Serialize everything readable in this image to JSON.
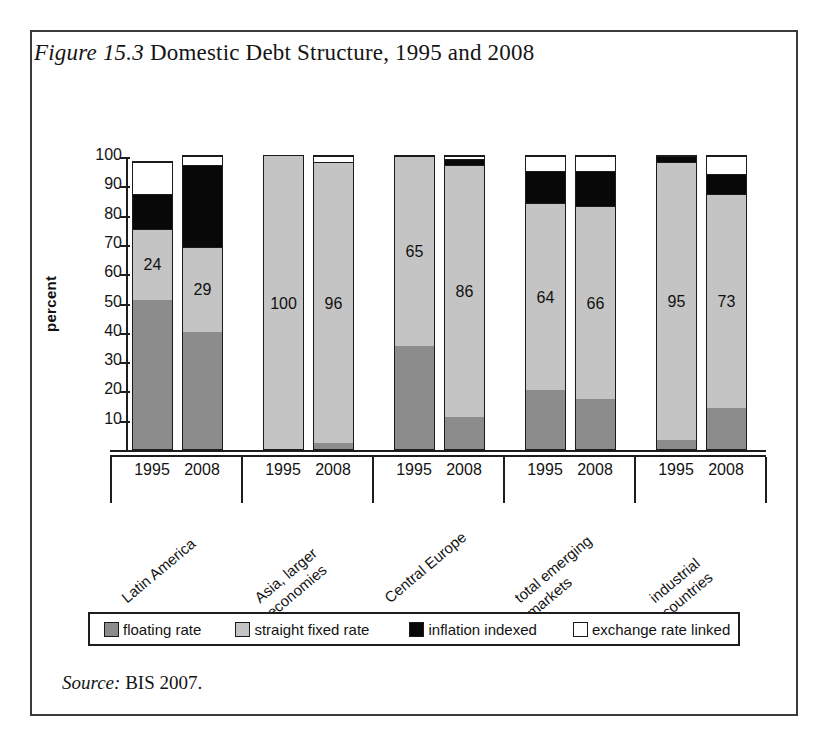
{
  "figure": {
    "label": "Figure 15.3",
    "title": " Domestic Debt Structure, 1995 and 2008",
    "source_label": "Source:",
    "source_text": " BIS 2007."
  },
  "axis": {
    "ylabel": "percent",
    "yticks": [
      "100",
      "90",
      "80",
      "70",
      "60",
      "50",
      "40",
      "30",
      "20",
      "10"
    ]
  },
  "legend": {
    "items": [
      {
        "label": "floating rate",
        "color": "#8c8c8c",
        "key": "floating"
      },
      {
        "label": "straight fixed rate",
        "color": "#c4c4c4",
        "key": "fixed"
      },
      {
        "label": "inflation indexed",
        "color": "#080808",
        "key": "inflation"
      },
      {
        "label": "exchange rate linked",
        "color": "#ffffff",
        "key": "exchange"
      }
    ]
  },
  "groups": [
    {
      "name_line1": "Latin America",
      "name_line2": "",
      "years": [
        "1995",
        "2008"
      ]
    },
    {
      "name_line1": "Asia, larger",
      "name_line2": "economies",
      "years": [
        "1995",
        "2008"
      ]
    },
    {
      "name_line1": "Central Europe",
      "name_line2": "",
      "years": [
        "1995",
        "2008"
      ]
    },
    {
      "name_line1": "total emerging",
      "name_line2": "markets",
      "years": [
        "1995",
        "2008"
      ]
    },
    {
      "name_line1": "industrial",
      "name_line2": "countries",
      "years": [
        "1995",
        "2008"
      ]
    }
  ],
  "chart_data": {
    "type": "bar",
    "subtype": "stacked-column",
    "title": "Figure 15.3 Domestic Debt Structure, 1995 and 2008",
    "xlabel": "",
    "ylabel": "percent",
    "ylim": [
      0,
      100
    ],
    "ytick_step": 10,
    "grid": false,
    "legend_position": "bottom",
    "stack_order_bottom_to_top": [
      "floating rate",
      "straight fixed rate",
      "inflation indexed",
      "exchange rate linked"
    ],
    "categories": [
      "Latin America 1995",
      "Latin America 2008",
      "Asia, larger economies 1995",
      "Asia, larger economies 2008",
      "Central Europe 1995",
      "Central Europe 2008",
      "total emerging markets 1995",
      "total emerging markets 2008",
      "industrial countries 1995",
      "industrial countries 2008"
    ],
    "series": [
      {
        "name": "floating rate",
        "values": [
          51,
          40,
          0,
          2,
          35,
          11,
          20,
          17,
          3,
          14
        ]
      },
      {
        "name": "straight fixed rate",
        "values": [
          24,
          29,
          100,
          96,
          65,
          86,
          64,
          66,
          95,
          73
        ]
      },
      {
        "name": "inflation indexed",
        "values": [
          12,
          28,
          0,
          0,
          0,
          2,
          11,
          12,
          2,
          7
        ]
      },
      {
        "name": "exchange rate linked",
        "values": [
          11,
          3,
          0,
          2,
          0,
          1,
          5,
          5,
          0,
          6
        ]
      }
    ],
    "data_labels": {
      "series": "straight fixed rate",
      "values": [
        24,
        29,
        100,
        96,
        65,
        86,
        64,
        66,
        95,
        73
      ]
    },
    "source": "BIS 2007."
  },
  "bars": [
    {
      "group": 0,
      "year": "1995",
      "label": "24",
      "floating": 51,
      "fixed": 24,
      "inflation": 12,
      "exchange": 11
    },
    {
      "group": 0,
      "year": "2008",
      "label": "29",
      "floating": 40,
      "fixed": 29,
      "inflation": 28,
      "exchange": 3
    },
    {
      "group": 1,
      "year": "1995",
      "label": "100",
      "floating": 0,
      "fixed": 100,
      "inflation": 0,
      "exchange": 0
    },
    {
      "group": 1,
      "year": "2008",
      "label": "96",
      "floating": 2,
      "fixed": 96,
      "inflation": 0,
      "exchange": 2
    },
    {
      "group": 2,
      "year": "1995",
      "label": "65",
      "floating": 35,
      "fixed": 65,
      "inflation": 0,
      "exchange": 0
    },
    {
      "group": 2,
      "year": "2008",
      "label": "86",
      "floating": 11,
      "fixed": 86,
      "inflation": 2,
      "exchange": 1
    },
    {
      "group": 3,
      "year": "1995",
      "label": "64",
      "floating": 20,
      "fixed": 64,
      "inflation": 11,
      "exchange": 5
    },
    {
      "group": 3,
      "year": "2008",
      "label": "66",
      "floating": 17,
      "fixed": 66,
      "inflation": 12,
      "exchange": 5
    },
    {
      "group": 4,
      "year": "1995",
      "label": "95",
      "floating": 3,
      "fixed": 95,
      "inflation": 2,
      "exchange": 0
    },
    {
      "group": 4,
      "year": "2008",
      "label": "73",
      "floating": 14,
      "fixed": 73,
      "inflation": 7,
      "exchange": 6
    }
  ]
}
